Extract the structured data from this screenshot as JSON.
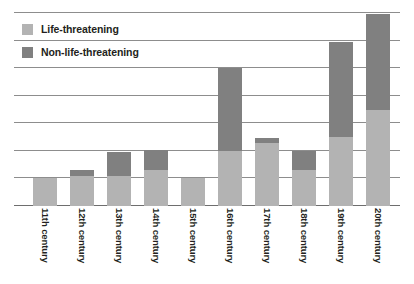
{
  "legend": {
    "position": "top-left",
    "items": [
      {
        "label": "Life-threatening",
        "color": "#b3b3b3",
        "key": "life_threatening"
      },
      {
        "label": "Non-life-threatening",
        "color": "#808080",
        "key": "non_life_threatening"
      }
    ]
  },
  "colors": {
    "life_threatening": "#b3b3b3",
    "non_life_threatening": "#808080",
    "gridline": "#8d8d8d",
    "axis": "#6e6e6e",
    "text": "#231f20",
    "background": "#ffffff"
  },
  "axis": {
    "x_tick_labels": [
      "11th century",
      "12th century",
      "13th century",
      "14th century",
      "15th century",
      "16th century",
      "17th century",
      "18th century",
      "19th century",
      "20th century"
    ],
    "y_tick_labels": [],
    "gridline_count": 8
  },
  "chart_data": {
    "type": "bar",
    "subtype": "stacked-vertical",
    "title": "",
    "subtitle": "",
    "xlabel": "",
    "ylabel": "",
    "grid": true,
    "legend_position": "top-left",
    "ylim": [
      0,
      7
    ],
    "y_gridlines": [
      0,
      1,
      2,
      3,
      4,
      5,
      6,
      7
    ],
    "categories": [
      "11th century",
      "12th century",
      "13th century",
      "14th century",
      "15th century",
      "16th century",
      "17th century",
      "18th century",
      "19th century",
      "20th century"
    ],
    "series": [
      {
        "name": "Life-threatening",
        "color": "#b3b3b3",
        "values": [
          1.0,
          1.1,
          1.1,
          1.3,
          1.0,
          2.0,
          2.3,
          1.3,
          2.5,
          3.5
        ]
      },
      {
        "name": "Non-life-threatening",
        "color": "#808080",
        "values": [
          0.0,
          0.2,
          0.85,
          0.75,
          0.0,
          3.0,
          0.15,
          0.7,
          3.45,
          3.45
        ]
      }
    ],
    "totals": [
      1.0,
      1.3,
      1.95,
      2.05,
      1.0,
      5.0,
      2.45,
      2.0,
      5.95,
      6.95
    ]
  },
  "layout": {
    "plot": {
      "left": 14,
      "top": 13,
      "width": 386,
      "height": 193
    },
    "bar_width_px": 24,
    "bar_centers_px": [
      31,
      68,
      105,
      142,
      179,
      216,
      253,
      290,
      327,
      364
    ]
  }
}
